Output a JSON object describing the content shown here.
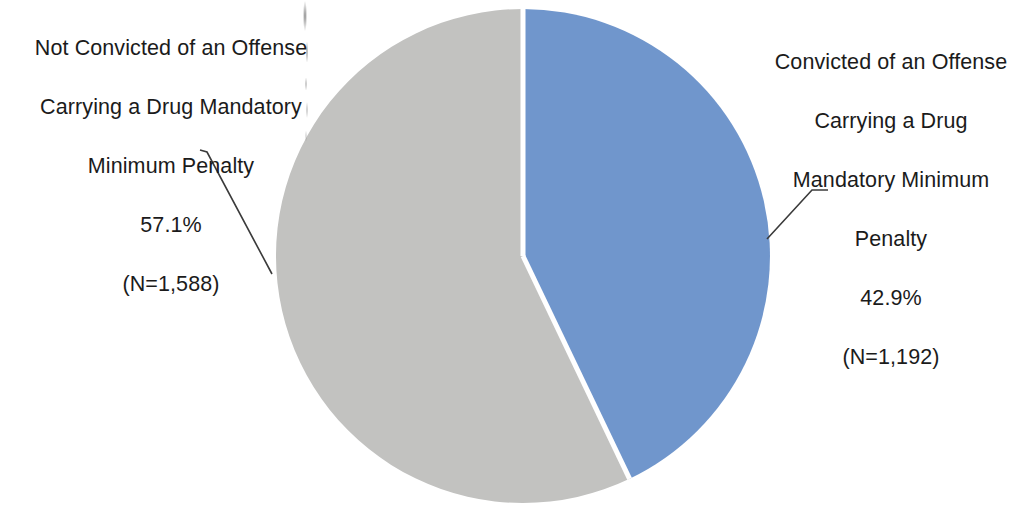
{
  "chart_data": {
    "type": "pie",
    "title": "",
    "subtitle": "",
    "xlabel": "",
    "ylabel": "",
    "legend_position": "none",
    "grid": false,
    "total_n": 2780,
    "categories": [
      "Not Convicted of an Offense Carrying a Drug Mandatory Minimum Penalty",
      "Convicted of an Offense Carrying a Drug Mandatory Minimum Penalty"
    ],
    "values": [
      57.1,
      42.9
    ],
    "counts": [
      1588,
      1192
    ],
    "value_labels": [
      "57.1%",
      "42.9%"
    ],
    "count_labels": [
      "(N=1,588)",
      "(N=1,192)"
    ],
    "colors": [
      "#c2c2c0",
      "#7096cc"
    ],
    "slices": [
      {
        "name": "Not Convicted of an Offense Carrying a Drug Mandatory Minimum Penalty",
        "percent": 57.1,
        "percent_label": "57.1%",
        "count": 1588,
        "count_label": "(N=1,588)",
        "color": "#c2c2c0",
        "start_angle_deg": 154.4,
        "end_angle_deg": 360.0
      },
      {
        "name": "Convicted of an Offense Carrying a Drug Mandatory Minimum Penalty",
        "percent": 42.9,
        "percent_label": "42.9%",
        "count": 1192,
        "count_label": "(N=1,192)",
        "color": "#7096cc",
        "start_angle_deg": 0.0,
        "end_angle_deg": 154.4
      }
    ]
  },
  "labels": {
    "left": {
      "line1": "Not Convicted of an Offense",
      "line2": "Carrying a Drug Mandatory",
      "line3": "Minimum Penalty",
      "percent": "57.1%",
      "count": "(N=1,588)"
    },
    "right": {
      "line1": "Convicted of an Offense",
      "line2": "Carrying a Drug",
      "line3": "Mandatory Minimum",
      "line4": "Penalty",
      "percent": "42.9%",
      "count": "(N=1,192)"
    }
  },
  "style": {
    "background": "#ffffff",
    "text_color": "#1b1b1b",
    "leader_line_color": "#3b3b3b",
    "slice_gap_color": "#ffffff"
  }
}
